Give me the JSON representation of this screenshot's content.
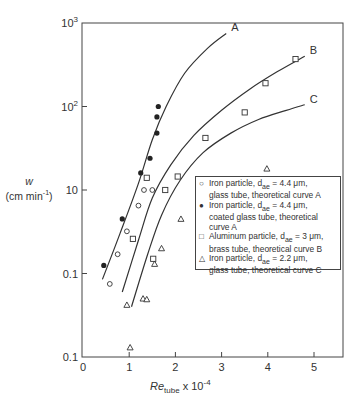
{
  "chart_data": {
    "type": "scatter",
    "title": "",
    "xlabel": "Re_tube x 10^-4",
    "ylabel": "w (cm min^-1)",
    "xscale": "linear",
    "yscale": "log",
    "xlim": [
      0,
      5.6
    ],
    "ylim": [
      0.1,
      1000
    ],
    "x_ticks": [
      0,
      1,
      2,
      3,
      4,
      5
    ],
    "x_tick_labels": [
      "0",
      "1",
      "2",
      "3",
      "4",
      "5"
    ],
    "y_ticks": [
      1000,
      100,
      10,
      1,
      0.1
    ],
    "y_tick_labels": [
      "10^3",
      "10^2",
      "10",
      "0.1",
      "0.1"
    ],
    "grid": false,
    "legend_position": "right-middle inside",
    "series": [
      {
        "name": "Iron particle, d_ae = 4.4 μm, glass tube, theoretical curve A",
        "marker": "open-circle",
        "points": [
          [
            0.58,
            0.75
          ],
          [
            0.75,
            1.7
          ],
          [
            0.95,
            3.2
          ],
          [
            1.2,
            6.5
          ],
          [
            1.32,
            10
          ],
          [
            1.5,
            10
          ]
        ]
      },
      {
        "name": "Iron particle, d_ae = 4.4 μm, coated glass tube, theoretical curve A",
        "marker": "filled-circle",
        "points": [
          [
            0.45,
            1.25
          ],
          [
            0.85,
            4.5
          ],
          [
            1.25,
            16
          ],
          [
            1.45,
            24
          ],
          [
            1.6,
            48
          ],
          [
            1.6,
            75
          ],
          [
            1.63,
            100
          ]
        ]
      },
      {
        "name": "Aluminum particle, d_ae = 3 μm, brass tube, theoretical curve B",
        "marker": "open-square",
        "points": [
          [
            1.08,
            2.6
          ],
          [
            1.38,
            14
          ],
          [
            1.52,
            1.5
          ],
          [
            1.78,
            10
          ],
          [
            2.05,
            14.5
          ],
          [
            2.65,
            42
          ],
          [
            3.5,
            85
          ],
          [
            3.95,
            190
          ],
          [
            4.6,
            370
          ]
        ]
      },
      {
        "name": "Iron particle, d_ae = 2.2 μm, glass tube, theoretical curve C",
        "marker": "open-triangle",
        "points": [
          [
            0.95,
            0.42
          ],
          [
            1.02,
            0.13
          ],
          [
            1.3,
            0.5
          ],
          [
            1.38,
            0.49
          ],
          [
            1.55,
            1.3
          ],
          [
            1.7,
            2.0
          ],
          [
            2.12,
            4.5
          ],
          [
            3.98,
            18
          ]
        ]
      }
    ],
    "curves": [
      {
        "label": "A",
        "points": [
          [
            0.42,
            0.85
          ],
          [
            0.8,
            3.0
          ],
          [
            1.2,
            12
          ],
          [
            1.5,
            40
          ],
          [
            1.8,
            100
          ],
          [
            2.2,
            250
          ],
          [
            2.7,
            500
          ],
          [
            3.1,
            750
          ]
        ]
      },
      {
        "label": "B",
        "points": [
          [
            0.85,
            0.6
          ],
          [
            1.2,
            2.5
          ],
          [
            1.5,
            8
          ],
          [
            1.9,
            20
          ],
          [
            2.4,
            45
          ],
          [
            3.0,
            90
          ],
          [
            3.6,
            160
          ],
          [
            4.2,
            260
          ],
          [
            4.8,
            400
          ]
        ]
      },
      {
        "label": "C",
        "points": [
          [
            1.05,
            0.4
          ],
          [
            1.4,
            1.7
          ],
          [
            1.7,
            5
          ],
          [
            2.1,
            13
          ],
          [
            2.6,
            28
          ],
          [
            3.2,
            48
          ],
          [
            3.8,
            70
          ],
          [
            4.4,
            90
          ],
          [
            4.8,
            105
          ]
        ]
      }
    ],
    "annotations": [
      "A",
      "B",
      "C"
    ]
  },
  "axes": {
    "y_label_line1": "w",
    "y_label_line2": "(cm min",
    "y_label_sup": "-1",
    "y_label_close": ")",
    "x_label_main": "Re",
    "x_label_sub": "tube",
    "x_label_rest": " x 10",
    "x_label_sup": "-4"
  },
  "legend": {
    "items": [
      {
        "marker": "○",
        "line1": "Iron particle, d",
        "sub": "ae",
        "line1b": " = 4.4 μm,",
        "line2": "glass tube, theoretical curve A"
      },
      {
        "marker": "●",
        "line1": "Iron particle, d",
        "sub": "ae",
        "line1b": " = 4.4 μm,",
        "line2": "coated glass tube, theoretical curve A"
      },
      {
        "marker": "□",
        "line1": "Aluminum particle, d",
        "sub": "ae",
        "line1b": " = 3 μm,",
        "line2": "brass tube, theoretical curve B"
      },
      {
        "marker": "△",
        "line1": "Iron particle, d",
        "sub": "ae",
        "line1b": " = 2.2 μm,",
        "line2": "glass tube, theoretical curve C"
      }
    ]
  }
}
